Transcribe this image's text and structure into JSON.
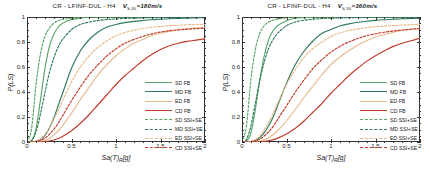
{
  "figure": {
    "panels": [
      {
        "id": "left",
        "title_main": "CR - LFINF-DUL - H4",
        "title_vs_symbol": "V",
        "title_vs_sub": "S,30",
        "title_vs_value": "=180m/s"
      },
      {
        "id": "right",
        "title_main": "CR - LFINF-DUL - H4",
        "title_vs_symbol": "V",
        "title_vs_sub": "S,30",
        "title_vs_value": "=360m/s"
      }
    ],
    "axes": {
      "xlabel_main": "Sa(T)",
      "xlabel_sub": "R",
      "xlabel_unit": "[g]",
      "ylabel": "P(LS)",
      "xticks": [
        "0",
        "0.5",
        "1",
        "1.5",
        "2"
      ],
      "xtick_values": [
        0,
        0.5,
        1,
        1.5,
        2
      ],
      "yticks": [
        "0",
        "0.2",
        "0.4",
        "0.6",
        "0.8",
        "1"
      ],
      "ytick_values": [
        0,
        0.2,
        0.4,
        0.6,
        0.8,
        1
      ],
      "xlim": [
        0,
        2
      ],
      "ylim": [
        0,
        1
      ],
      "grid": false
    },
    "legend": {
      "position": "center-right",
      "entries": [
        {
          "label": "SD FB",
          "color": "#5aa469",
          "dash": "solid"
        },
        {
          "label": "MD FB",
          "color": "#2f7a5a",
          "dash": "solid"
        },
        {
          "label": "ED FB",
          "color": "#e8b98c",
          "dash": "solid"
        },
        {
          "label": "CD FB",
          "color": "#c0392b",
          "dash": "solid"
        },
        {
          "label": "SD SSI+SE",
          "color": "#5aa469",
          "dash": "dashed"
        },
        {
          "label": "MD SSI+SE",
          "color": "#2f7a5a",
          "dash": "dashed"
        },
        {
          "label": "ED SSI+SE",
          "color": "#e8b98c",
          "dash": "dashed"
        },
        {
          "label": "CD SSI+SE",
          "color": "#c0392b",
          "dash": "dashed"
        }
      ]
    }
  },
  "chart_data": [
    {
      "type": "line",
      "panel": "left",
      "title": "CR - LFINF-DUL - H4   V_S,30=180m/s",
      "xlabel": "Sa(T)_R[g]",
      "ylabel": "P(LS)",
      "xlim": [
        0,
        2
      ],
      "ylim": [
        0,
        1
      ],
      "grid": false,
      "legend_position": "center-right",
      "x": [
        0,
        0.05,
        0.1,
        0.15,
        0.2,
        0.25,
        0.3,
        0.35,
        0.4,
        0.5,
        0.6,
        0.7,
        0.8,
        0.9,
        1.0,
        1.1,
        1.2,
        1.3,
        1.4,
        1.5,
        1.6,
        1.7,
        1.8,
        1.9,
        2.0
      ],
      "series": [
        {
          "name": "SD FB",
          "color": "#5aa469",
          "dash": "solid",
          "values": [
            0,
            0.01,
            0.1,
            0.33,
            0.58,
            0.76,
            0.86,
            0.92,
            0.95,
            0.98,
            0.99,
            1.0,
            1.0,
            1.0,
            1.0,
            1.0,
            1.0,
            1.0,
            1.0,
            1.0,
            1.0,
            1.0,
            1.0,
            1.0,
            1.0
          ]
        },
        {
          "name": "MD FB",
          "color": "#2f7a5a",
          "dash": "solid",
          "values": [
            0,
            0,
            0.005,
            0.02,
            0.05,
            0.11,
            0.19,
            0.29,
            0.39,
            0.59,
            0.73,
            0.82,
            0.88,
            0.92,
            0.94,
            0.955,
            0.965,
            0.972,
            0.978,
            0.982,
            0.986,
            0.989,
            0.991,
            0.993,
            0.995
          ]
        },
        {
          "name": "ED FB",
          "color": "#e8b98c",
          "dash": "solid",
          "values": [
            0,
            0,
            0,
            0.004,
            0.012,
            0.03,
            0.055,
            0.09,
            0.13,
            0.23,
            0.34,
            0.44,
            0.54,
            0.62,
            0.69,
            0.745,
            0.79,
            0.82,
            0.85,
            0.87,
            0.885,
            0.895,
            0.905,
            0.912,
            0.918
          ]
        },
        {
          "name": "CD FB",
          "color": "#c0392b",
          "dash": "solid",
          "values": [
            0,
            0,
            0,
            0,
            0.003,
            0.008,
            0.016,
            0.028,
            0.045,
            0.09,
            0.15,
            0.22,
            0.3,
            0.38,
            0.46,
            0.53,
            0.59,
            0.65,
            0.7,
            0.74,
            0.77,
            0.79,
            0.805,
            0.815,
            0.825
          ]
        },
        {
          "name": "SD SSI+SE",
          "color": "#5aa469",
          "dash": "dashed",
          "values": [
            0,
            0.1,
            0.45,
            0.7,
            0.84,
            0.91,
            0.95,
            0.97,
            0.98,
            0.99,
            1.0,
            1.0,
            1.0,
            1.0,
            1.0,
            1.0,
            1.0,
            1.0,
            1.0,
            1.0,
            1.0,
            1.0,
            1.0,
            1.0,
            1.0
          ]
        },
        {
          "name": "MD SSI+SE",
          "color": "#2f7a5a",
          "dash": "dashed",
          "values": [
            0,
            0.01,
            0.08,
            0.22,
            0.39,
            0.55,
            0.67,
            0.76,
            0.82,
            0.9,
            0.94,
            0.96,
            0.972,
            0.98,
            0.985,
            0.989,
            0.991,
            0.993,
            0.995,
            0.996,
            0.997,
            0.997,
            0.998,
            0.998,
            0.999
          ]
        },
        {
          "name": "ED SSI+SE",
          "color": "#e8b98c",
          "dash": "dashed",
          "values": [
            0,
            0,
            0.006,
            0.025,
            0.06,
            0.11,
            0.18,
            0.25,
            0.33,
            0.48,
            0.6,
            0.69,
            0.76,
            0.81,
            0.85,
            0.875,
            0.895,
            0.908,
            0.918,
            0.925,
            0.93,
            0.934,
            0.938,
            0.94,
            0.942
          ]
        },
        {
          "name": "CD SSI+SE",
          "color": "#c0392b",
          "dash": "dashed",
          "values": [
            0,
            0,
            0.003,
            0.012,
            0.03,
            0.06,
            0.1,
            0.15,
            0.21,
            0.33,
            0.44,
            0.54,
            0.62,
            0.69,
            0.745,
            0.79,
            0.82,
            0.845,
            0.865,
            0.88,
            0.89,
            0.898,
            0.903,
            0.907,
            0.91
          ]
        }
      ]
    },
    {
      "type": "line",
      "panel": "right",
      "title": "CR - LFINF-DUL - H4   V_S,30=360m/s",
      "xlabel": "Sa(T)_R[g]",
      "ylabel": "P(LS)",
      "xlim": [
        0,
        2
      ],
      "ylim": [
        0,
        1
      ],
      "grid": false,
      "legend_position": "center-right",
      "x": [
        0,
        0.05,
        0.1,
        0.15,
        0.2,
        0.25,
        0.3,
        0.35,
        0.4,
        0.5,
        0.6,
        0.7,
        0.8,
        0.9,
        1.0,
        1.1,
        1.2,
        1.3,
        1.4,
        1.5,
        1.6,
        1.7,
        1.8,
        1.9,
        2.0
      ],
      "series": [
        {
          "name": "SD FB",
          "color": "#5aa469",
          "dash": "solid",
          "values": [
            0,
            0.005,
            0.07,
            0.26,
            0.5,
            0.69,
            0.82,
            0.89,
            0.93,
            0.97,
            0.99,
            0.995,
            1.0,
            1.0,
            1.0,
            1.0,
            1.0,
            1.0,
            1.0,
            1.0,
            1.0,
            1.0,
            1.0,
            1.0,
            1.0
          ]
        },
        {
          "name": "MD FB",
          "color": "#2f7a5a",
          "dash": "solid",
          "values": [
            0,
            0,
            0.003,
            0.013,
            0.035,
            0.075,
            0.13,
            0.2,
            0.29,
            0.47,
            0.62,
            0.73,
            0.81,
            0.87,
            0.9,
            0.928,
            0.945,
            0.958,
            0.966,
            0.973,
            0.978,
            0.982,
            0.986,
            0.988,
            0.99
          ]
        },
        {
          "name": "ED FB",
          "color": "#e8b98c",
          "dash": "solid",
          "values": [
            0,
            0,
            0,
            0.002,
            0.007,
            0.018,
            0.035,
            0.06,
            0.09,
            0.17,
            0.26,
            0.36,
            0.45,
            0.54,
            0.62,
            0.68,
            0.73,
            0.775,
            0.81,
            0.84,
            0.86,
            0.878,
            0.892,
            0.902,
            0.912
          ]
        },
        {
          "name": "CD FB",
          "color": "#c0392b",
          "dash": "solid",
          "values": [
            0,
            0,
            0,
            0,
            0.002,
            0.005,
            0.01,
            0.019,
            0.031,
            0.065,
            0.11,
            0.17,
            0.24,
            0.31,
            0.39,
            0.46,
            0.53,
            0.59,
            0.645,
            0.69,
            0.73,
            0.765,
            0.79,
            0.81,
            0.83
          ]
        },
        {
          "name": "SD SSI+SE",
          "color": "#5aa469",
          "dash": "dashed",
          "values": [
            0,
            0.13,
            0.5,
            0.74,
            0.87,
            0.93,
            0.96,
            0.975,
            0.985,
            0.993,
            1.0,
            1.0,
            1.0,
            1.0,
            1.0,
            1.0,
            1.0,
            1.0,
            1.0,
            1.0,
            1.0,
            1.0,
            1.0,
            1.0,
            1.0
          ]
        },
        {
          "name": "MD SSI+SE",
          "color": "#2f7a5a",
          "dash": "dashed",
          "values": [
            0,
            0.02,
            0.13,
            0.31,
            0.49,
            0.64,
            0.75,
            0.82,
            0.87,
            0.93,
            0.96,
            0.974,
            0.982,
            0.988,
            0.991,
            0.993,
            0.995,
            0.996,
            0.997,
            0.998,
            0.998,
            0.999,
            0.999,
            0.999,
            1.0
          ]
        },
        {
          "name": "ED SSI+SE",
          "color": "#e8b98c",
          "dash": "dashed",
          "values": [
            0,
            0,
            0.005,
            0.02,
            0.05,
            0.1,
            0.16,
            0.23,
            0.31,
            0.46,
            0.58,
            0.68,
            0.75,
            0.8,
            0.845,
            0.872,
            0.892,
            0.905,
            0.915,
            0.923,
            0.928,
            0.932,
            0.936,
            0.939,
            0.941
          ]
        },
        {
          "name": "CD SSI+SE",
          "color": "#c0392b",
          "dash": "dashed",
          "values": [
            0,
            0,
            0.002,
            0.009,
            0.023,
            0.048,
            0.082,
            0.125,
            0.18,
            0.29,
            0.4,
            0.5,
            0.59,
            0.66,
            0.72,
            0.765,
            0.8,
            0.828,
            0.85,
            0.866,
            0.878,
            0.888,
            0.896,
            0.902,
            0.907
          ]
        }
      ]
    }
  ]
}
